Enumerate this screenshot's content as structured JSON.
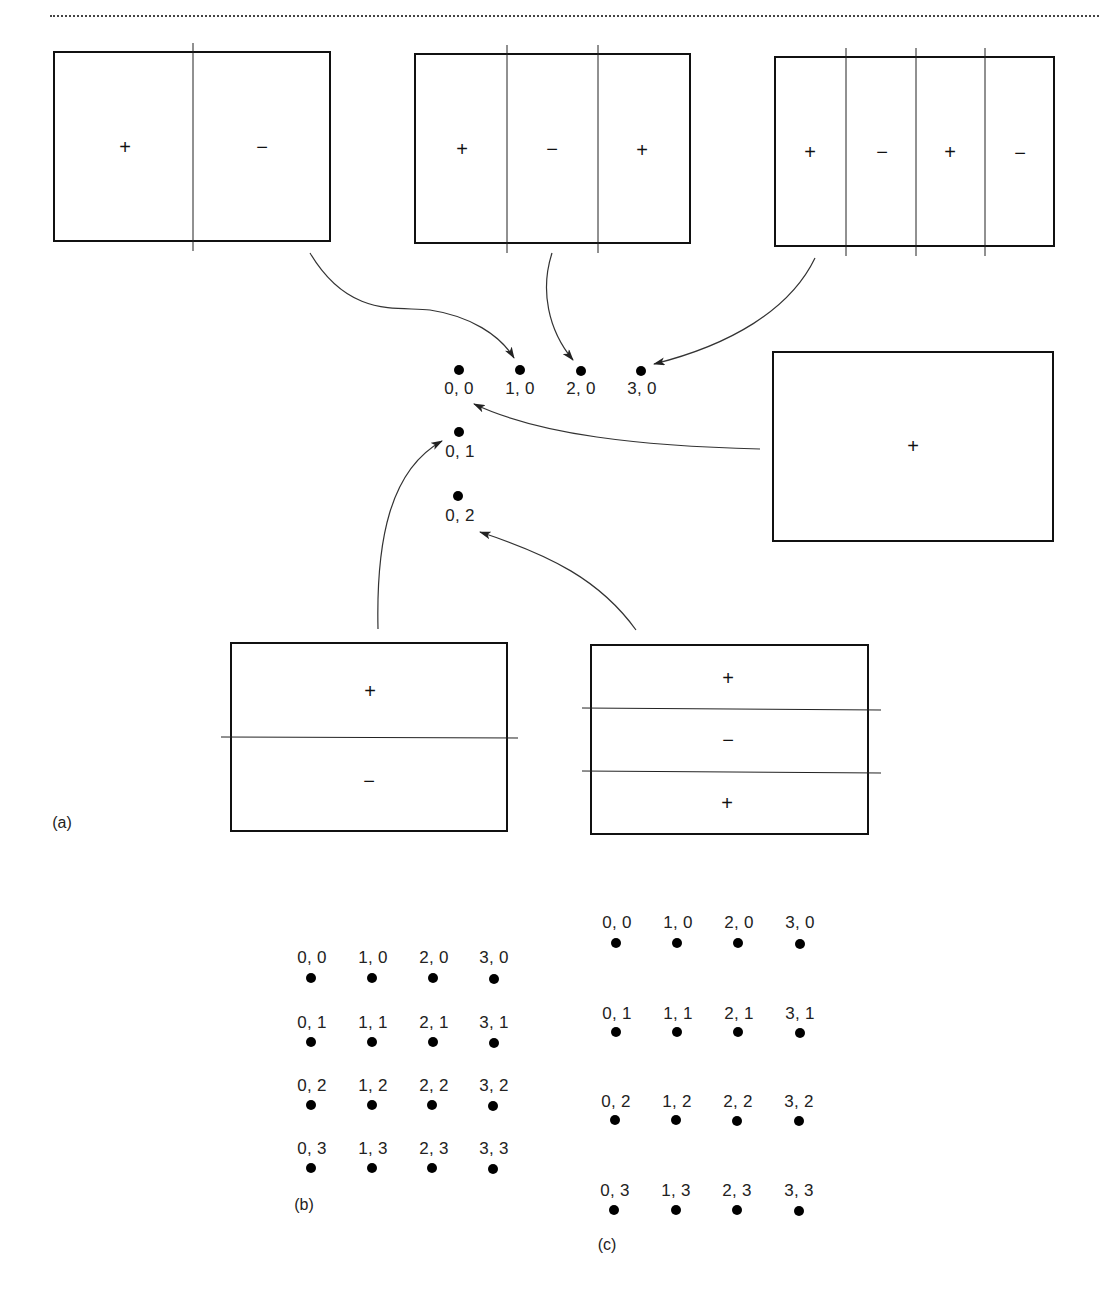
{
  "figure": {
    "panel_a": {
      "caption": "(a)",
      "boxes": [
        {
          "id": "box-2x1",
          "orientation": "vertical",
          "signs": [
            "+",
            "−"
          ]
        },
        {
          "id": "box-3x1",
          "orientation": "vertical",
          "signs": [
            "+",
            "−",
            "+"
          ]
        },
        {
          "id": "box-4x1",
          "orientation": "vertical",
          "signs": [
            "+",
            "−",
            "+",
            "−"
          ]
        },
        {
          "id": "box-uniform",
          "orientation": "none",
          "signs": [
            "+"
          ]
        },
        {
          "id": "box-1x2",
          "orientation": "horizontal",
          "signs": [
            "+",
            "−"
          ]
        },
        {
          "id": "box-1x3",
          "orientation": "horizontal",
          "signs": [
            "+",
            "−",
            "+"
          ]
        }
      ],
      "points": [
        {
          "label": "0, 0"
        },
        {
          "label": "1, 0"
        },
        {
          "label": "2, 0"
        },
        {
          "label": "3, 0"
        },
        {
          "label": "0, 1"
        },
        {
          "label": "0, 2"
        }
      ],
      "arrows": [
        {
          "from": "box-2x1",
          "to": "1, 0"
        },
        {
          "from": "box-3x1",
          "to": "2, 0"
        },
        {
          "from": "box-4x1",
          "to": "3, 0"
        },
        {
          "from": "box-uniform",
          "to": "0, 0"
        },
        {
          "from": "box-1x2",
          "to": "0, 1"
        },
        {
          "from": "box-1x3",
          "to": "0, 2"
        }
      ]
    },
    "panel_b": {
      "caption": "(b)",
      "rows": [
        [
          "0, 0",
          "1, 0",
          "2, 0",
          "3, 0"
        ],
        [
          "0, 1",
          "1, 1",
          "2, 1",
          "3, 1"
        ],
        [
          "0, 2",
          "1, 2",
          "2, 2",
          "3, 2"
        ],
        [
          "0, 3",
          "1, 3",
          "2, 3",
          "3, 3"
        ]
      ]
    },
    "panel_c": {
      "caption": "(c)",
      "rows": [
        [
          "0, 0",
          "1, 0",
          "2, 0",
          "3, 0"
        ],
        [
          "0, 1",
          "1, 1",
          "2, 1",
          "3, 1"
        ],
        [
          "0, 2",
          "1, 2",
          "2, 2",
          "3, 2"
        ],
        [
          "0, 3",
          "1, 3",
          "2, 3",
          "3, 3"
        ]
      ]
    }
  }
}
